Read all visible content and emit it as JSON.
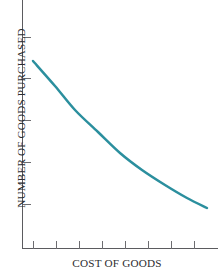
{
  "chart_data": {
    "type": "line",
    "title": "",
    "subtitle": "",
    "xlabel": "COST OF GOODS",
    "ylabel": "NUMBER OF GOODS PURCHASED",
    "grid": false,
    "legend": null,
    "legend_position": "none",
    "annotations": [],
    "xtick_labels": [
      "",
      "",
      "",
      "",
      "",
      "",
      "",
      ""
    ],
    "ytick_labels": [
      "",
      "",
      "",
      "",
      ""
    ],
    "xlim": [
      0,
      1
    ],
    "ylim": [
      0,
      1
    ],
    "series": [
      {
        "name": "Demand curve",
        "color": "#2b8f9e",
        "x": [
          0.0,
          0.125,
          0.25,
          0.375,
          0.5,
          0.625,
          0.75,
          0.875,
          1.0
        ],
        "y": [
          1.0,
          0.855,
          0.725,
          0.615,
          0.515,
          0.425,
          0.345,
          0.275,
          0.215
        ],
        "points_px": [
          [
            33,
            61
          ],
          [
            55,
            86
          ],
          [
            75,
            110
          ],
          [
            98,
            132
          ],
          [
            120,
            153
          ],
          [
            142,
            170
          ],
          [
            165,
            185
          ],
          [
            187,
            198
          ],
          [
            207,
            208
          ]
        ]
      }
    ],
    "axis": {
      "line_color": "#5b5b5f",
      "tick_color": "#6d6d71",
      "x_tick_count": 8,
      "y_tick_count": 5,
      "x_tick_px": [
        33,
        56,
        79,
        102,
        125,
        148,
        171,
        194
      ],
      "y_tick_px": [
        37,
        78,
        120,
        162,
        204
      ]
    },
    "colors": {
      "curve": "#2b8f9e",
      "axis": "#5b5b5f",
      "text": "#2d2d30",
      "background": "#ffffff"
    }
  },
  "labels": {
    "y_axis_title": "NUMBER OF GOODS PURCHASED",
    "x_axis_title": "COST OF GOODS"
  }
}
